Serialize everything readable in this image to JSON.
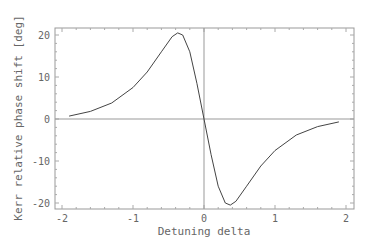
{
  "chart_data": {
    "type": "line",
    "title": "",
    "xlabel": "Detuning delta",
    "ylabel": "Kerr relative phase shift [deg]",
    "xlim": [
      -2,
      2
    ],
    "ylim": [
      -22,
      22
    ],
    "x_ticks": [
      "-2",
      "-1",
      "0",
      "1",
      "2"
    ],
    "y_ticks": [
      "20",
      "10",
      "0",
      "-10",
      "-20"
    ],
    "grid": false,
    "legend": null,
    "series": [
      {
        "name": "Kerr phase shift",
        "x": [
          -1.9,
          -1.6,
          -1.3,
          -1.0,
          -0.8,
          -0.6,
          -0.45,
          -0.37,
          -0.3,
          -0.2,
          -0.1,
          0.0,
          0.1,
          0.2,
          0.3,
          0.37,
          0.45,
          0.6,
          0.8,
          1.0,
          1.3,
          1.6,
          1.9
        ],
        "values": [
          0.7,
          1.8,
          3.8,
          7.5,
          11.2,
          16.0,
          19.6,
          20.5,
          20.0,
          16.0,
          8.5,
          0.0,
          -8.5,
          -16.0,
          -20.0,
          -20.5,
          -19.6,
          -16.0,
          -11.2,
          -7.5,
          -3.8,
          -1.8,
          -0.7
        ]
      }
    ]
  }
}
